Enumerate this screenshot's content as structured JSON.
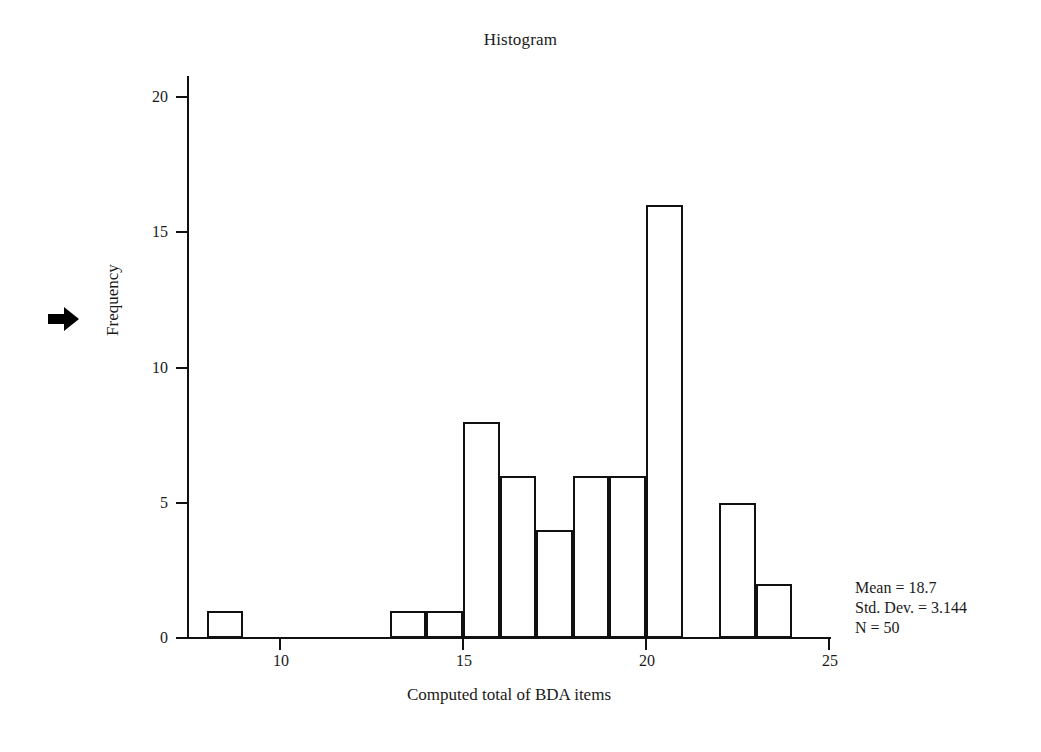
{
  "chart_data": {
    "type": "bar",
    "title": "Histogram",
    "xlabel": "Computed  total of BDA items",
    "ylabel": "Frequency",
    "xlim": [
      7.5,
      25.0
    ],
    "ylim": [
      0,
      21
    ],
    "grid": false,
    "legend": "none",
    "bin_width": 1,
    "x_ticks": [
      10,
      15,
      20,
      25
    ],
    "x_tick_labels": [
      "10",
      "15",
      "20",
      "25"
    ],
    "y_ticks": [
      0,
      5,
      10,
      15,
      20
    ],
    "y_tick_labels": [
      "0",
      "5",
      "10",
      "15",
      "20"
    ],
    "bins": [
      {
        "start": 8,
        "end": 9,
        "value": 1
      },
      {
        "start": 13,
        "end": 14,
        "value": 1
      },
      {
        "start": 14,
        "end": 15,
        "value": 1
      },
      {
        "start": 15,
        "end": 16,
        "value": 8
      },
      {
        "start": 16,
        "end": 17,
        "value": 6
      },
      {
        "start": 17,
        "end": 18,
        "value": 4
      },
      {
        "start": 18,
        "end": 19,
        "value": 6
      },
      {
        "start": 19,
        "end": 20,
        "value": 6
      },
      {
        "start": 20,
        "end": 21,
        "value": 16
      },
      {
        "start": 22,
        "end": 23,
        "value": 5
      },
      {
        "start": 23,
        "end": 24,
        "value": 2
      }
    ],
    "categories": [
      "8-9",
      "13-14",
      "14-15",
      "15-16",
      "16-17",
      "17-18",
      "18-19",
      "19-20",
      "20-21",
      "22-23",
      "23-24"
    ],
    "values": [
      1,
      1,
      1,
      8,
      6,
      4,
      6,
      6,
      16,
      5,
      2
    ],
    "bar_fill": "#ffffff",
    "bar_stroke": "#111111"
  },
  "statistics": {
    "mean_line": "Mean = 18.7",
    "std_dev_line": "Std. Dev. = 3.144",
    "n_line": "N = 50",
    "mean": 18.7,
    "std_dev": 3.144,
    "n": 50
  },
  "annotations": {
    "arrow_marker": "right-arrow"
  }
}
